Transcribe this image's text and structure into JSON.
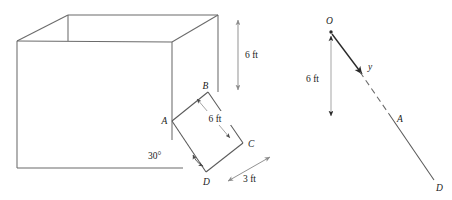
{
  "figure": {
    "colors": {
      "box_line": "#6b6b6b",
      "flap_line": "#5a5a5a",
      "dim_arrow": "#8c8c8c",
      "ray_line": "#5a5a5a",
      "text": "#1a1a1a",
      "background": "#ffffff"
    },
    "left_diagram": {
      "name": "open-box-with-flap",
      "vertex_labels": {
        "A": "A",
        "B": "B",
        "C": "C",
        "D": "D"
      },
      "dimensions": {
        "height": "6 ft",
        "flap_width": "6 ft",
        "depth": "3 ft"
      },
      "angle": "30°"
    },
    "right_diagram": {
      "name": "line-segment-diagram",
      "point_labels": {
        "O": "O",
        "A": "A",
        "D": "D"
      },
      "segment_label": "y",
      "vertical_dimension": "6 ft"
    }
  }
}
